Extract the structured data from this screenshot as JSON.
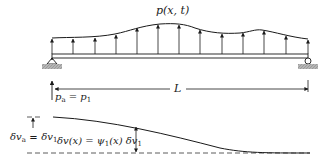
{
  "diagram": {
    "load_label": "p(x, t)",
    "span_label": "L",
    "point_load": {
      "lhs": "p",
      "lhs_sub": "a",
      "eq": " = ",
      "rhs": "p",
      "rhs_sub": "1"
    },
    "displacement_label": {
      "lhs": "δv",
      "lhs_sub": "a",
      "eq": " = ",
      "rhs": "δv",
      "rhs_sub": "1"
    },
    "shape_function_label": {
      "text": "δv(x) = ψ",
      "sub1": "1",
      "mid": "(x) δv",
      "sub2": "1"
    },
    "colors": {
      "line": "#1a1a1a",
      "ground": "#9a9a9a",
      "dashed": "#333333"
    },
    "load_arrows_x": [
      52,
      73,
      95,
      116,
      137,
      158,
      179,
      200,
      222,
      243,
      264,
      286,
      308
    ]
  }
}
